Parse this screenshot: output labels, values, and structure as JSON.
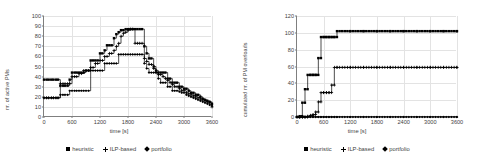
{
  "chart_data": [
    {
      "type": "line",
      "panel": "left",
      "title": "",
      "xlabel": "time [s]",
      "ylabel": "nr. of active PMs",
      "xlim": [
        0,
        3600
      ],
      "ylim": [
        0,
        100
      ],
      "xticks": [
        0,
        600,
        1200,
        1800,
        2400,
        3000,
        3600
      ],
      "yticks": [
        0,
        10,
        20,
        30,
        40,
        50,
        60,
        70,
        80,
        90,
        100
      ],
      "grid": true,
      "legend_position": "bottom",
      "series": [
        {
          "name": "heuristic",
          "marker": "square",
          "x": [
            0,
            100,
            200,
            300,
            350,
            450,
            550,
            600,
            700,
            750,
            800,
            850,
            900,
            1000,
            1050,
            1100,
            1150,
            1200,
            1250,
            1300,
            1350,
            1400,
            1450,
            1500,
            1550,
            1600,
            1650,
            1700,
            1750,
            1800,
            1850,
            1900,
            1950,
            2000,
            2050,
            2100,
            2150,
            2200,
            2250,
            2300,
            2350,
            2400,
            2450,
            2500,
            2550,
            2600,
            2650,
            2700,
            2750,
            2800,
            2850,
            2900,
            2950,
            3000,
            3050,
            3100,
            3150,
            3200,
            3250,
            3300,
            3350,
            3400,
            3450,
            3500,
            3550,
            3600
          ],
          "y": [
            37,
            37,
            37,
            37,
            31,
            31,
            37,
            44,
            44,
            44,
            44,
            44,
            46,
            56,
            56,
            56,
            56,
            63,
            63,
            66,
            71,
            71,
            71,
            78,
            82,
            84,
            86,
            86,
            87,
            87,
            87,
            87,
            87,
            87,
            87,
            87,
            70,
            63,
            58,
            58,
            50,
            46,
            44,
            44,
            44,
            44,
            38,
            38,
            34,
            34,
            34,
            30,
            30,
            28,
            28,
            26,
            24,
            24,
            22,
            22,
            20,
            18,
            17,
            16,
            15,
            13
          ]
        },
        {
          "name": "ILP-based",
          "marker": "plus",
          "x": [
            0,
            100,
            200,
            300,
            350,
            450,
            550,
            600,
            700,
            750,
            800,
            850,
            900,
            1000,
            1050,
            1100,
            1150,
            1200,
            1250,
            1300,
            1350,
            1400,
            1450,
            1500,
            1550,
            1600,
            1650,
            1700,
            1750,
            1800,
            1850,
            1900,
            1950,
            2000,
            2050,
            2100,
            2150,
            2200,
            2250,
            2300,
            2350,
            2400,
            2450,
            2500,
            2550,
            2600,
            2650,
            2700,
            2750,
            2800,
            2850,
            2900,
            2950,
            3000,
            3050,
            3100,
            3150,
            3200,
            3250,
            3300,
            3350,
            3400,
            3450,
            3500,
            3550,
            3600
          ],
          "y": [
            19,
            19,
            19,
            19,
            33,
            33,
            33,
            40,
            40,
            43,
            43,
            46,
            46,
            49,
            49,
            53,
            53,
            56,
            56,
            60,
            60,
            63,
            63,
            66,
            70,
            73,
            80,
            83,
            84,
            86,
            87,
            87,
            73,
            73,
            73,
            73,
            58,
            55,
            52,
            52,
            48,
            44,
            42,
            42,
            40,
            38,
            36,
            34,
            32,
            30,
            30,
            28,
            26,
            26,
            24,
            23,
            22,
            21,
            20,
            19,
            18,
            17,
            16,
            15,
            14,
            10
          ]
        },
        {
          "name": "portfolio",
          "marker": "diamond",
          "x": [
            0,
            100,
            200,
            300,
            350,
            450,
            550,
            600,
            700,
            750,
            800,
            850,
            900,
            1000,
            1050,
            1100,
            1150,
            1200,
            1250,
            1300,
            1350,
            1400,
            1450,
            1500,
            1550,
            1600,
            1650,
            1700,
            1750,
            1800,
            1850,
            1900,
            1950,
            2000,
            2050,
            2100,
            2150,
            2200,
            2250,
            2300,
            2350,
            2400,
            2450,
            2500,
            2550,
            2600,
            2650,
            2700,
            2750,
            2800,
            2850,
            2900,
            2950,
            3000,
            3050,
            3100,
            3150,
            3200,
            3250,
            3300,
            3350,
            3400,
            3450,
            3500,
            3550,
            3600
          ],
          "y": [
            19,
            19,
            19,
            19,
            22,
            22,
            26,
            26,
            26,
            26,
            26,
            26,
            26,
            46,
            46,
            46,
            46,
            46,
            46,
            53,
            53,
            53,
            53,
            53,
            53,
            62,
            62,
            62,
            62,
            62,
            62,
            62,
            62,
            62,
            62,
            62,
            53,
            48,
            44,
            44,
            44,
            44,
            38,
            34,
            34,
            34,
            30,
            30,
            26,
            26,
            26,
            25,
            24,
            24,
            22,
            21,
            20,
            19,
            18,
            17,
            16,
            15,
            14,
            13,
            12,
            11
          ]
        }
      ]
    },
    {
      "type": "line",
      "panel": "right",
      "title": "",
      "xlabel": "time [s]",
      "ylabel": "cumulated nr. of PM overloads",
      "xlim": [
        0,
        3600
      ],
      "ylim": [
        0,
        120
      ],
      "xticks": [
        0,
        600,
        1200,
        1800,
        2400,
        3000,
        3600
      ],
      "yticks": [
        0,
        20,
        40,
        60,
        80,
        100,
        120
      ],
      "grid": true,
      "legend_position": "bottom",
      "series": [
        {
          "name": "heuristic",
          "marker": "square",
          "x": [
            0,
            60,
            120,
            180,
            240,
            300,
            360,
            420,
            480,
            540,
            600,
            660,
            720,
            780,
            840,
            900,
            1200,
            1500,
            1800,
            2100,
            2400,
            2700,
            3000,
            3300,
            3600
          ],
          "y": [
            0,
            1,
            17,
            33,
            50,
            50,
            50,
            50,
            70,
            95,
            95,
            95,
            95,
            95,
            95,
            102,
            102,
            102,
            102,
            102,
            102,
            102,
            102,
            102,
            102
          ]
        },
        {
          "name": "ILP-based",
          "marker": "plus",
          "x": [
            0,
            60,
            120,
            180,
            240,
            300,
            360,
            420,
            480,
            540,
            600,
            660,
            720,
            780,
            840,
            900,
            1200,
            1500,
            1800,
            2100,
            2400,
            2700,
            3000,
            3300,
            3600
          ],
          "y": [
            0,
            0,
            0,
            0,
            1,
            2,
            3,
            6,
            18,
            29,
            29,
            29,
            29,
            38,
            59,
            59,
            59,
            59,
            59,
            59,
            59,
            59,
            59,
            59,
            59
          ]
        },
        {
          "name": "portfolio",
          "marker": "diamond",
          "x": [
            0,
            60,
            120,
            180,
            240,
            300,
            360,
            420,
            480,
            540,
            600,
            660,
            720,
            780,
            840,
            900,
            1200,
            1500,
            1800,
            2100,
            2400,
            2700,
            3000,
            3300,
            3600
          ],
          "y": [
            0,
            0,
            0,
            0,
            0,
            0,
            0,
            0,
            0,
            0,
            0,
            0,
            0,
            0,
            0,
            0,
            0,
            0,
            0,
            0,
            0,
            0,
            0,
            0,
            0
          ]
        }
      ]
    }
  ],
  "left": {
    "ylabel": "nr. of active PMs",
    "xlabel": "time [s]",
    "yticks": [
      "100",
      "90",
      "80",
      "70",
      "60",
      "50",
      "40",
      "30",
      "20",
      "10",
      "0"
    ],
    "xticks": [
      "0",
      "600",
      "1200",
      "1800",
      "2400",
      "3000",
      "3600"
    ],
    "legend": [
      {
        "label": "heuristic",
        "marker": "square"
      },
      {
        "label": "ILP-based",
        "marker": "plus"
      },
      {
        "label": "portfolio",
        "marker": "diamond"
      }
    ]
  },
  "right": {
    "ylabel": "cumulated nr. of PM overloads",
    "xlabel": "time [s]",
    "yticks": [
      "120",
      "100",
      "80",
      "60",
      "40",
      "20",
      "0"
    ],
    "xticks": [
      "0",
      "600",
      "1200",
      "1800",
      "2400",
      "3000",
      "3600"
    ],
    "legend": [
      {
        "label": "heuristic",
        "marker": "square"
      },
      {
        "label": "ILP-based",
        "marker": "plus"
      },
      {
        "label": "portfolio",
        "marker": "diamond"
      }
    ]
  },
  "colors": {
    "series": "#000000",
    "axis": "#7f7f7f",
    "grid": "#e3e3e3",
    "text": "#3f3f3f"
  }
}
